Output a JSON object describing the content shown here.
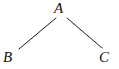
{
  "figure": {
    "kind": "tree-diagram",
    "width": 119,
    "height": 69,
    "background_color": "#ffffff",
    "line_color": "#1a1a1a",
    "text_color": "#111111",
    "line_width": 1
  },
  "nodes": [
    {
      "id": "A",
      "label": "A",
      "role": "root",
      "x": 62,
      "y": 8
    },
    {
      "id": "B",
      "label": "B",
      "role": "left-child",
      "x": 10,
      "y": 58
    },
    {
      "id": "C",
      "label": "C",
      "role": "right-child",
      "x": 106,
      "y": 58
    }
  ],
  "edges": [
    {
      "from": "A",
      "to": "B",
      "x1": 56,
      "y1": 18,
      "x2": 19,
      "y2": 49
    },
    {
      "from": "A",
      "to": "C",
      "x1": 67,
      "y1": 18,
      "x2": 102,
      "y2": 48
    }
  ]
}
